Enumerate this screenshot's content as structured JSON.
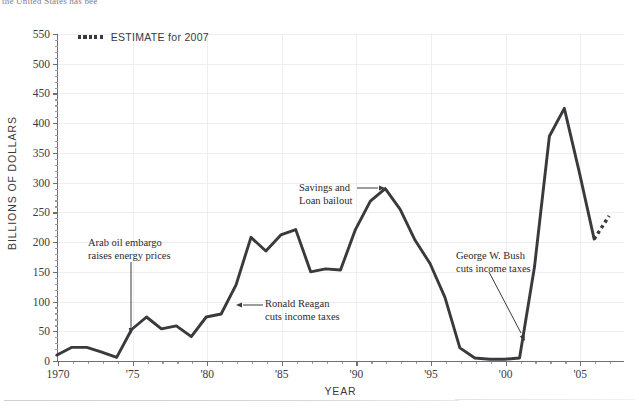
{
  "page": {
    "clipped_header_text": "the United States has bee"
  },
  "legend": {
    "marker_name": "dotted-line-swatch",
    "label": "ESTIMATE for 2007"
  },
  "axes": {
    "y_title": "BILLIONS OF DOLLARS",
    "x_title": "YEAR",
    "y_ticks": [
      "0",
      "50",
      "100",
      "150",
      "200",
      "250",
      "300",
      "350",
      "400",
      "450",
      "500",
      "550"
    ],
    "x_ticks": [
      "1970",
      "'75",
      "'80",
      "'85",
      "'90",
      "'95",
      "'00",
      "'05"
    ]
  },
  "annotations": [
    {
      "id": "arab-oil-embargo",
      "line1": "Arab oil embargo",
      "line2": "raises energy prices"
    },
    {
      "id": "ronald-reagan-tax-cuts",
      "line1": "Ronald Reagan",
      "line2": "cuts income taxes"
    },
    {
      "id": "savings-loan-bailout",
      "line1": "Savings and",
      "line2": "Loan bailout"
    },
    {
      "id": "george-w-bush-tax-cuts",
      "line1": "George W. Bush",
      "line2": "cuts income taxes"
    }
  ],
  "colors": {
    "line": "#3a3a3e",
    "grid": "#eeeef1",
    "axis": "#6f6f75",
    "text": "#2b2b2b"
  },
  "chart_data": {
    "type": "line",
    "title": "",
    "xlabel": "YEAR",
    "ylabel": "BILLIONS OF DOLLARS",
    "xlim": [
      1970,
      2007
    ],
    "ylim": [
      0,
      550
    ],
    "ytick_step": 50,
    "grid": true,
    "legend_position": "top-left",
    "series": [
      {
        "name": "Federal budget deficit",
        "style": "solid",
        "x": [
          1970,
          1971,
          1972,
          1973,
          1974,
          1975,
          1976,
          1977,
          1978,
          1979,
          1980,
          1981,
          1982,
          1983,
          1984,
          1985,
          1986,
          1987,
          1988,
          1989,
          1990,
          1991,
          1992,
          1993,
          1994,
          1995,
          1996,
          1997,
          1998,
          1999,
          2000,
          2001,
          2002,
          2003,
          2004,
          2005,
          2006
        ],
        "values": [
          10,
          23,
          23,
          15,
          6,
          53,
          74,
          54,
          59,
          41,
          74,
          79,
          128,
          208,
          185,
          212,
          221,
          150,
          155,
          153,
          221,
          269,
          290,
          255,
          203,
          164,
          107,
          22,
          5,
          3,
          3,
          5,
          158,
          378,
          425,
          318,
          205
        ]
      },
      {
        "name": "ESTIMATE for 2007",
        "style": "dotted",
        "x": [
          2006,
          2007
        ],
        "values": [
          205,
          244
        ]
      }
    ]
  }
}
